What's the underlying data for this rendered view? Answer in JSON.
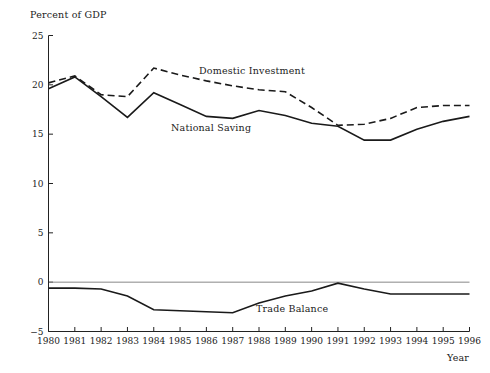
{
  "chart_data": {
    "type": "line",
    "title": "",
    "ylabel": "Percent of GDP",
    "xlabel": "Year",
    "grid": false,
    "legend_position": "inline-annotations",
    "x": [
      1980,
      1981,
      1982,
      1983,
      1984,
      1985,
      1986,
      1987,
      1988,
      1989,
      1990,
      1991,
      1992,
      1993,
      1994,
      1995,
      1996
    ],
    "xlim": [
      1980,
      1996
    ],
    "ylim": [
      -5,
      25
    ],
    "yticks": [
      -5,
      0,
      5,
      10,
      15,
      20,
      25
    ],
    "ytick_labels": [
      "−5",
      "0",
      "5",
      "10",
      "15",
      "20",
      "25"
    ],
    "xtick_labels": [
      "1980",
      "1981",
      "1982",
      "1983",
      "1984",
      "1985",
      "1986",
      "1987",
      "1988",
      "1989",
      "1990",
      "1991",
      "1992",
      "1993",
      "1994",
      "1995",
      "1996"
    ],
    "zero_line": 0,
    "series": [
      {
        "name": "Domestic Investment",
        "style": "dashed",
        "label_text": "Domestic Investment",
        "values": [
          20.2,
          20.9,
          19.0,
          18.8,
          21.7,
          21.0,
          20.4,
          19.9,
          19.5,
          19.3,
          17.7,
          15.9,
          16.0,
          16.6,
          17.7,
          17.9,
          17.9
        ]
      },
      {
        "name": "National Saving",
        "style": "solid",
        "label_text": "National Saving",
        "values": [
          19.6,
          20.8,
          18.8,
          16.7,
          19.2,
          18.0,
          16.8,
          16.6,
          17.4,
          16.9,
          16.1,
          15.8,
          14.4,
          14.4,
          15.5,
          16.3,
          16.8
        ]
      },
      {
        "name": "Trade Balance",
        "style": "solid",
        "label_text": "Trade Balance",
        "values": [
          -0.6,
          -0.6,
          -0.7,
          -1.4,
          -2.8,
          -2.9,
          -3.0,
          -3.1,
          -2.1,
          -1.4,
          -0.9,
          -0.1,
          -0.7,
          -1.2,
          -1.2,
          -1.2,
          -1.2
        ]
      }
    ]
  },
  "labels": {
    "ylabel": "Percent of GDP",
    "xlabel": "Year",
    "domestic_investment": "Domestic Investment",
    "national_saving": "National Saving",
    "trade_balance": "Trade Balance"
  },
  "colors": {
    "ink": "#1a1a1a",
    "axis": "#222222",
    "zero_line": "#888888",
    "background": "#ffffff"
  }
}
